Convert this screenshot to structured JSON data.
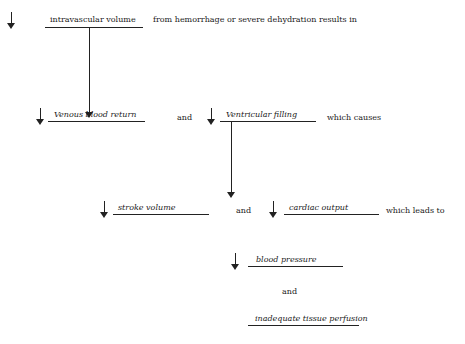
{
  "diagram": {
    "row1": {
      "term": "intravascular volume",
      "suffix": "from hemorrhage or severe dehydration results in"
    },
    "row2": {
      "term1": "Venous blood return",
      "joiner": "and",
      "term2": "Ventricular filling",
      "suffix": "which causes"
    },
    "row3": {
      "term1": "stroke volume",
      "joiner": "and",
      "term2": "cardiac output",
      "suffix": "which leads to"
    },
    "row4": {
      "term": "blood pressure",
      "joiner": "and",
      "final": "inadequate tissue perfusion"
    },
    "icons": {
      "decrease": "down-arrow"
    }
  }
}
